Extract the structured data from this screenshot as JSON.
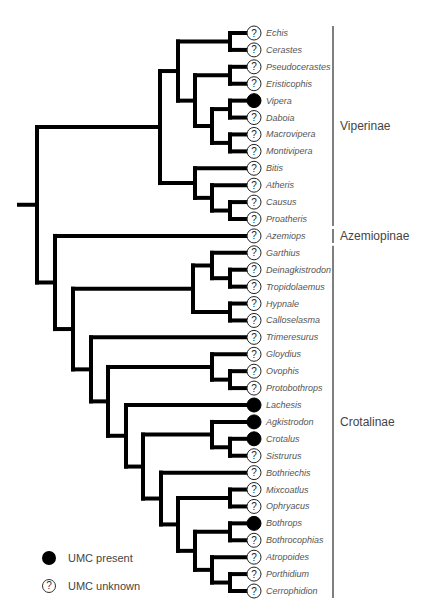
{
  "header": {
    "clipped_text": ""
  },
  "tips": [
    {
      "name": "Echis",
      "umc": "unknown"
    },
    {
      "name": "Cerastes",
      "umc": "unknown"
    },
    {
      "name": "Pseudocerastes",
      "umc": "unknown"
    },
    {
      "name": "Eristicophis",
      "umc": "unknown"
    },
    {
      "name": "Vipera",
      "umc": "present"
    },
    {
      "name": "Daboia",
      "umc": "unknown"
    },
    {
      "name": "Macrovipera",
      "umc": "unknown"
    },
    {
      "name": "Montivipera",
      "umc": "unknown"
    },
    {
      "name": "Bitis",
      "umc": "unknown"
    },
    {
      "name": "Atheris",
      "umc": "unknown"
    },
    {
      "name": "Causus",
      "umc": "unknown"
    },
    {
      "name": "Proatheris",
      "umc": "unknown"
    },
    {
      "name": "Azemiops",
      "umc": "unknown"
    },
    {
      "name": "Garthius",
      "umc": "unknown"
    },
    {
      "name": "Deinagkistrodon",
      "umc": "unknown"
    },
    {
      "name": "Tropidolaemus",
      "umc": "unknown"
    },
    {
      "name": "Hypnale",
      "umc": "unknown"
    },
    {
      "name": "Calloselasma",
      "umc": "unknown"
    },
    {
      "name": "Trimeresurus",
      "umc": "unknown"
    },
    {
      "name": "Gloydius",
      "umc": "unknown"
    },
    {
      "name": "Ovophis",
      "umc": "unknown"
    },
    {
      "name": "Protobothrops",
      "umc": "unknown"
    },
    {
      "name": "Lachesis",
      "umc": "present"
    },
    {
      "name": "Agkistrodon",
      "umc": "present"
    },
    {
      "name": "Crotalus",
      "umc": "present"
    },
    {
      "name": "Sistrurus",
      "umc": "unknown"
    },
    {
      "name": "Bothriechis",
      "umc": "unknown"
    },
    {
      "name": "Mixcoatlus",
      "umc": "unknown"
    },
    {
      "name": "Ophryacus",
      "umc": "unknown"
    },
    {
      "name": "Bothrops",
      "umc": "present"
    },
    {
      "name": "Bothrocophias",
      "umc": "unknown"
    },
    {
      "name": "Atropoides",
      "umc": "unknown"
    },
    {
      "name": "Porthidium",
      "umc": "unknown"
    },
    {
      "name": "Cerrophidion",
      "umc": "unknown"
    }
  ],
  "tree": {
    "x": 37,
    "children": [
      {
        "x": 160,
        "children": [
          {
            "x": 178,
            "children": [
              {
                "x": 230,
                "children": [
                  0,
                  1
                ]
              },
              {
                "x": 195,
                "children": [
                  {
                    "x": 230,
                    "children": [
                      2,
                      3
                    ]
                  },
                  {
                    "x": 212,
                    "children": [
                      {
                        "x": 230,
                        "children": [
                          4,
                          5
                        ]
                      },
                      {
                        "x": 230,
                        "children": [
                          6,
                          7
                        ]
                      }
                    ]
                  }
                ]
              }
            ]
          },
          {
            "x": 195,
            "children": [
              8,
              {
                "x": 212,
                "children": [
                  9,
                  {
                    "x": 230,
                    "children": [
                      10,
                      11
                    ]
                  }
                ]
              }
            ]
          }
        ]
      },
      {
        "x": 55,
        "children": [
          12,
          {
            "x": 73,
            "children": [
              {
                "x": 193,
                "children": [
                  {
                    "x": 212,
                    "children": [
                      13,
                      {
                        "x": 230,
                        "children": [
                          14,
                          15
                        ]
                      }
                    ]
                  },
                  {
                    "x": 230,
                    "children": [
                      16,
                      17
                    ]
                  }
                ]
              },
              {
                "x": 91,
                "children": [
                  18,
                  {
                    "x": 108,
                    "children": [
                      {
                        "x": 212,
                        "children": [
                          19,
                          {
                            "x": 230,
                            "children": [
                              20,
                              21
                            ]
                          }
                        ]
                      },
                      {
                        "x": 126,
                        "children": [
                          22,
                          {
                            "x": 143,
                            "children": [
                              {
                                "x": 212,
                                "children": [
                                  23,
                                  {
                                    "x": 230,
                                    "children": [
                                      24,
                                      25
                                    ]
                                  }
                                ]
                              },
                              {
                                "x": 161,
                                "children": [
                                  26,
                                  {
                                    "x": 178,
                                    "children": [
                                      {
                                        "x": 230,
                                        "children": [
                                          27,
                                          28
                                        ]
                                      },
                                      {
                                        "x": 195,
                                        "children": [
                                          {
                                            "x": 230,
                                            "children": [
                                              29,
                                              30
                                            ]
                                          },
                                          {
                                            "x": 212,
                                            "children": [
                                              31,
                                              {
                                                "x": 230,
                                                "children": [
                                                  32,
                                                  33
                                                ]
                                              }
                                            ]
                                          }
                                        ]
                                      }
                                    ]
                                  }
                                ]
                              }
                            ]
                          }
                        ]
                      }
                    ]
                  }
                ]
              }
            ]
          }
        ]
      }
    ]
  },
  "layout": {
    "root_stub_x": 19,
    "tip_x": 254,
    "first_tip_y": 33,
    "last_tip_y": 591,
    "label_x": 266,
    "branch_color": "#000000",
    "branch_width": 4,
    "clade_bar_x": 333,
    "clade_label_x": 340
  },
  "clades": [
    {
      "name": "Viperinae",
      "from": 0,
      "to": 11
    },
    {
      "name": "Azemiopinae",
      "from": 12,
      "to": 12
    },
    {
      "name": "Crotalinae",
      "from": 13,
      "to": 33
    }
  ],
  "legend": [
    {
      "type": "present",
      "label": "UMC present",
      "symbol": ""
    },
    {
      "type": "unknown",
      "label": "UMC unknown",
      "symbol": "?"
    }
  ]
}
